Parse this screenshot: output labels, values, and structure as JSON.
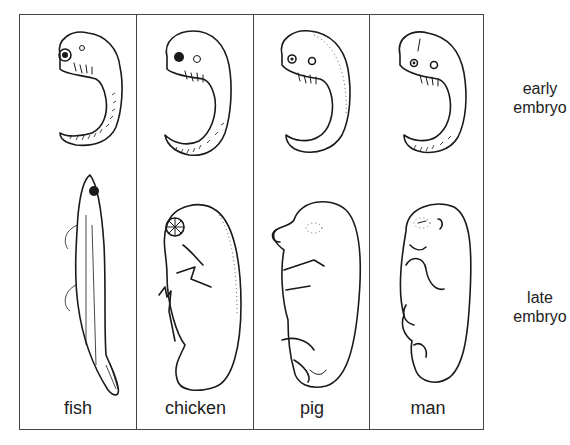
{
  "figure": {
    "columns": [
      {
        "id": "fish",
        "label": "fish"
      },
      {
        "id": "chicken",
        "label": "chicken"
      },
      {
        "id": "pig",
        "label": "pig"
      },
      {
        "id": "man",
        "label": "man"
      }
    ],
    "rows": [
      {
        "id": "early",
        "label_line1": "early",
        "label_line2": "embryo"
      },
      {
        "id": "late",
        "label_line1": "late",
        "label_line2": "embryo"
      }
    ],
    "colors": {
      "line": "#1a1a1a",
      "frame": "#444444",
      "background": "#ffffff"
    }
  }
}
